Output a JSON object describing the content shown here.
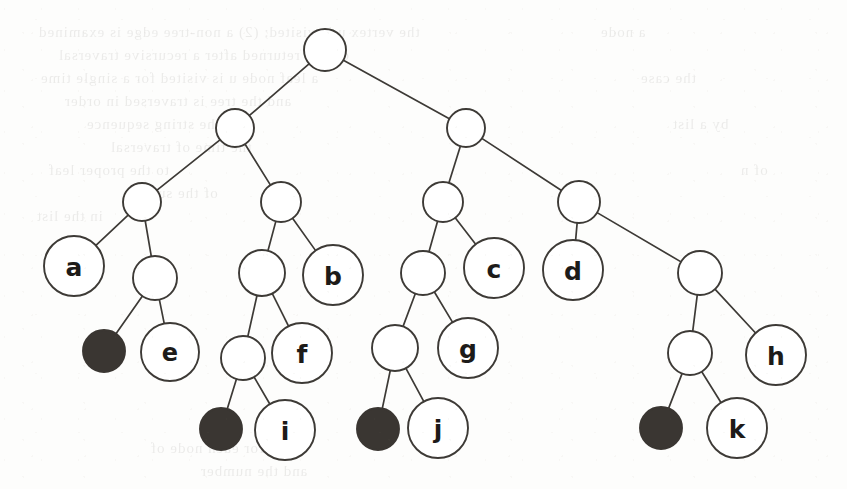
{
  "diagram": {
    "type": "binary-tree",
    "canvas": {
      "width": 847,
      "height": 489,
      "background": "#fdfdfc"
    },
    "style": {
      "stroke_color": "#3d3a36",
      "open_node_fill": "#ffffff",
      "filled_node_fill": "#3a3632",
      "label_color": "#1d1b19",
      "edge_width": 1.7,
      "node_stroke_width": 1.9
    },
    "levels": [
      {
        "index": 0,
        "y": 50,
        "name": "root"
      },
      {
        "index": 1,
        "y": 128,
        "name": "level-1"
      },
      {
        "index": 2,
        "y": 202,
        "name": "level-2"
      },
      {
        "index": 3,
        "y": 271,
        "name": "level-3"
      },
      {
        "index": 4,
        "y": 352,
        "name": "level-4"
      },
      {
        "index": 5,
        "y": 428,
        "name": "level-5"
      }
    ],
    "nodes": [
      {
        "id": "root",
        "label": "",
        "x": 325,
        "y": 50,
        "r": 21,
        "filled": false,
        "kind": "internal"
      },
      {
        "id": "n-l",
        "label": "",
        "x": 235,
        "y": 128,
        "r": 19,
        "filled": false,
        "kind": "internal"
      },
      {
        "id": "n-r",
        "label": "",
        "x": 466,
        "y": 128,
        "r": 19,
        "filled": false,
        "kind": "internal"
      },
      {
        "id": "n-ll",
        "label": "",
        "x": 142,
        "y": 202,
        "r": 19,
        "filled": false,
        "kind": "internal"
      },
      {
        "id": "n-lr",
        "label": "",
        "x": 281,
        "y": 202,
        "r": 20,
        "filled": false,
        "kind": "internal"
      },
      {
        "id": "n-rl",
        "label": "",
        "x": 443,
        "y": 202,
        "r": 20,
        "filled": false,
        "kind": "internal"
      },
      {
        "id": "n-rr",
        "label": "",
        "x": 579,
        "y": 202,
        "r": 21,
        "filled": false,
        "kind": "internal"
      },
      {
        "id": "a",
        "label": "a",
        "x": 74,
        "y": 266,
        "r": 30,
        "filled": false,
        "kind": "leaf"
      },
      {
        "id": "n-llr",
        "label": "",
        "x": 155,
        "y": 278,
        "r": 22,
        "filled": false,
        "kind": "internal"
      },
      {
        "id": "n-lrl",
        "label": "",
        "x": 262,
        "y": 273,
        "r": 23,
        "filled": false,
        "kind": "internal"
      },
      {
        "id": "b",
        "label": "b",
        "x": 333,
        "y": 275,
        "r": 30,
        "filled": false,
        "kind": "leaf"
      },
      {
        "id": "n-rll",
        "label": "",
        "x": 423,
        "y": 273,
        "r": 22,
        "filled": false,
        "kind": "internal"
      },
      {
        "id": "c",
        "label": "c",
        "x": 494,
        "y": 268,
        "r": 30,
        "filled": false,
        "kind": "leaf"
      },
      {
        "id": "d",
        "label": "d",
        "x": 573,
        "y": 270,
        "r": 30,
        "filled": false,
        "kind": "leaf"
      },
      {
        "id": "n-rrr",
        "label": "",
        "x": 700,
        "y": 273,
        "r": 22,
        "filled": false,
        "kind": "internal"
      },
      {
        "id": "nil1",
        "label": "",
        "x": 104,
        "y": 351,
        "r": 21,
        "filled": true,
        "kind": "nil-leaf"
      },
      {
        "id": "e",
        "label": "e",
        "x": 170,
        "y": 352,
        "r": 29,
        "filled": false,
        "kind": "leaf"
      },
      {
        "id": "n-lrll",
        "label": "",
        "x": 243,
        "y": 358,
        "r": 22,
        "filled": false,
        "kind": "internal"
      },
      {
        "id": "f",
        "label": "f",
        "x": 302,
        "y": 353,
        "r": 30,
        "filled": false,
        "kind": "leaf"
      },
      {
        "id": "n-rlll",
        "label": "",
        "x": 395,
        "y": 348,
        "r": 23,
        "filled": false,
        "kind": "internal"
      },
      {
        "id": "g",
        "label": "g",
        "x": 468,
        "y": 348,
        "r": 30,
        "filled": false,
        "kind": "leaf"
      },
      {
        "id": "n-rrrl",
        "label": "",
        "x": 690,
        "y": 353,
        "r": 22,
        "filled": false,
        "kind": "internal"
      },
      {
        "id": "h",
        "label": "h",
        "x": 776,
        "y": 355,
        "r": 30,
        "filled": false,
        "kind": "leaf"
      },
      {
        "id": "nil2",
        "label": "",
        "x": 221,
        "y": 429,
        "r": 21,
        "filled": true,
        "kind": "nil-leaf"
      },
      {
        "id": "i",
        "label": "i",
        "x": 285,
        "y": 430,
        "r": 30,
        "filled": false,
        "kind": "leaf"
      },
      {
        "id": "nil3",
        "label": "",
        "x": 378,
        "y": 429,
        "r": 21,
        "filled": true,
        "kind": "nil-leaf"
      },
      {
        "id": "j",
        "label": "j",
        "x": 438,
        "y": 428,
        "r": 30,
        "filled": false,
        "kind": "leaf"
      },
      {
        "id": "nil4",
        "label": "",
        "x": 661,
        "y": 428,
        "r": 21,
        "filled": true,
        "kind": "nil-leaf"
      },
      {
        "id": "k",
        "label": "k",
        "x": 737,
        "y": 428,
        "r": 30,
        "filled": false,
        "kind": "leaf"
      }
    ],
    "edges": [
      {
        "from": "root",
        "to": "n-l"
      },
      {
        "from": "root",
        "to": "n-r"
      },
      {
        "from": "n-l",
        "to": "n-ll"
      },
      {
        "from": "n-l",
        "to": "n-lr"
      },
      {
        "from": "n-r",
        "to": "n-rl"
      },
      {
        "from": "n-r",
        "to": "n-rr"
      },
      {
        "from": "n-ll",
        "to": "a"
      },
      {
        "from": "n-ll",
        "to": "n-llr"
      },
      {
        "from": "n-lr",
        "to": "n-lrl"
      },
      {
        "from": "n-lr",
        "to": "b"
      },
      {
        "from": "n-rl",
        "to": "n-rll"
      },
      {
        "from": "n-rl",
        "to": "c"
      },
      {
        "from": "n-rr",
        "to": "d"
      },
      {
        "from": "n-rr",
        "to": "n-rrr"
      },
      {
        "from": "n-llr",
        "to": "nil1"
      },
      {
        "from": "n-llr",
        "to": "e"
      },
      {
        "from": "n-lrl",
        "to": "n-lrll"
      },
      {
        "from": "n-lrl",
        "to": "f"
      },
      {
        "from": "n-rll",
        "to": "n-rlll"
      },
      {
        "from": "n-rll",
        "to": "g"
      },
      {
        "from": "n-rrr",
        "to": "n-rrrl"
      },
      {
        "from": "n-rrr",
        "to": "h"
      },
      {
        "from": "n-lrll",
        "to": "nil2"
      },
      {
        "from": "n-lrll",
        "to": "i"
      },
      {
        "from": "n-rlll",
        "to": "nil3"
      },
      {
        "from": "n-rlll",
        "to": "j"
      },
      {
        "from": "n-rrrl",
        "to": "nil4"
      },
      {
        "from": "n-rrrl",
        "to": "k"
      }
    ],
    "labels_in_reading_order": [
      "a",
      "b",
      "c",
      "d",
      "e",
      "f",
      "g",
      "h",
      "i",
      "j",
      "k"
    ],
    "filled_node_count": 4
  },
  "background_bleed": {
    "description": "faint mirrored show-through text from the reverse side of the scanned page",
    "lines": [
      {
        "text": "the vertex u is visited; (2) a non-tree edge is examined",
        "x": 38,
        "y": 24,
        "size": 15
      },
      {
        "text": "of u is returned after a recursive traversal",
        "x": 58,
        "y": 47,
        "size": 15
      },
      {
        "text": "a leaf node u is visited for a single time",
        "x": 40,
        "y": 70,
        "size": 15
      },
      {
        "text": "and the tree is traversed in order",
        "x": 64,
        "y": 93,
        "size": 15
      },
      {
        "text": "in the string sequence",
        "x": 86,
        "y": 116,
        "size": 15
      },
      {
        "text": "the time of traversal",
        "x": 110,
        "y": 139,
        "size": 15
      },
      {
        "text": "to the proper leaf",
        "x": 48,
        "y": 162,
        "size": 15
      },
      {
        "text": "of the subtree",
        "x": 122,
        "y": 185,
        "size": 15
      },
      {
        "text": "in the list",
        "x": 36,
        "y": 208,
        "size": 15
      },
      {
        "text": "a node",
        "x": 600,
        "y": 24,
        "size": 15
      },
      {
        "text": "the case",
        "x": 640,
        "y": 70,
        "size": 15
      },
      {
        "text": "by a list",
        "x": 672,
        "y": 116,
        "size": 15
      },
      {
        "text": "of n",
        "x": 740,
        "y": 162,
        "size": 15
      },
      {
        "text": "for each node of",
        "x": 150,
        "y": 440,
        "size": 15
      },
      {
        "text": "and the number",
        "x": 200,
        "y": 463,
        "size": 15
      }
    ]
  }
}
